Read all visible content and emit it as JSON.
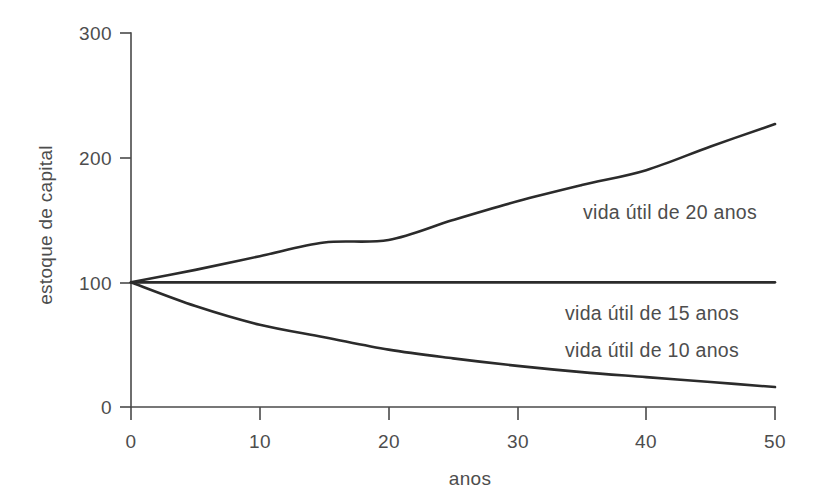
{
  "chart_data": {
    "type": "line",
    "title": "",
    "subtitle": "",
    "xlabel": "anos",
    "ylabel": "estoque de capital",
    "xlim": [
      0,
      50
    ],
    "ylim": [
      0,
      300
    ],
    "xticks": [
      0,
      10,
      20,
      30,
      40,
      50
    ],
    "xtick_labels": [
      "0",
      "10",
      "20",
      "30",
      "40",
      "50"
    ],
    "yticks": [
      0,
      100,
      200,
      300
    ],
    "ytick_labels": [
      "0",
      "100",
      "200",
      "300"
    ],
    "grid": false,
    "legend_position": "inline-annotations",
    "line_color": "#2b2b2b",
    "axis_color": "#4a4a4a",
    "text_color": "#4d4d4d",
    "background_color": "#ffffff",
    "x": [
      0,
      5,
      10,
      15,
      20,
      25,
      30,
      35,
      40,
      45,
      50
    ],
    "series": [
      {
        "name": "vida útil de 20 anos",
        "label": "vida útil de 20 anos",
        "values": [
          100,
          110,
          121,
          132,
          134,
          150,
          165,
          178,
          190,
          209,
          227
        ]
      },
      {
        "name": "vida útil de 15 anos",
        "label": "vida útil de 15 anos",
        "values": [
          100,
          100,
          100,
          100,
          100,
          100,
          100,
          100,
          100,
          100,
          100
        ]
      },
      {
        "name": "vida útil de 10 anos",
        "label": "vida útil de 10 anos",
        "values": [
          100,
          81,
          66,
          56,
          46,
          39,
          33,
          28,
          24,
          20,
          16
        ]
      }
    ],
    "annotations": [
      {
        "text": "vida útil de 20 anos",
        "x": 35,
        "y": 168
      },
      {
        "text": "vida útil de 15 anos",
        "x": 35,
        "y": 80
      },
      {
        "text": "vida útil de 10 anos",
        "x": 35,
        "y": 58
      }
    ]
  }
}
